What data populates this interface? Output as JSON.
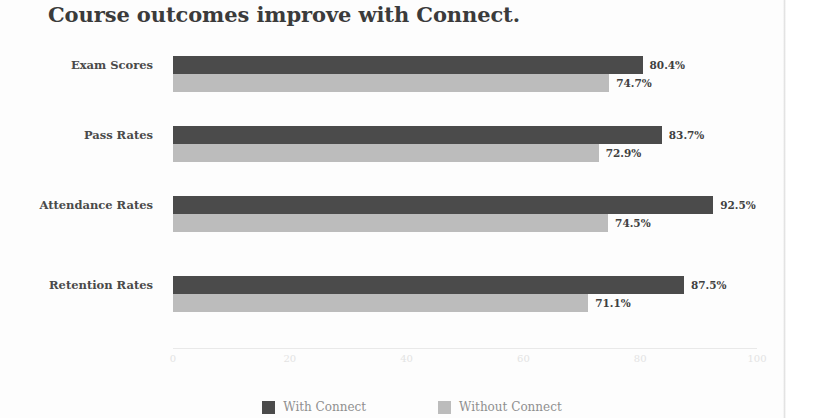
{
  "chart_data": {
    "type": "bar",
    "orientation": "horizontal",
    "title": "Course outcomes improve with Connect.",
    "categories": [
      "Exam Scores",
      "Pass Rates",
      "Attendance Rates",
      "Retention Rates"
    ],
    "series": [
      {
        "name": "With Connect",
        "color": "#4b4b4b",
        "values": [
          80.4,
          83.7,
          92.5,
          87.5
        ],
        "labels": [
          "80.4%",
          "83.7%",
          "92.5%",
          "87.5%"
        ]
      },
      {
        "name": "Without Connect",
        "color": "#bcbcbc",
        "values": [
          74.7,
          72.9,
          74.5,
          71.1
        ],
        "labels": [
          "74.7%",
          "72.9%",
          "74.5%",
          "71.1%"
        ]
      }
    ],
    "xlabel": "",
    "ylabel": "",
    "xlim": [
      0,
      100
    ],
    "xticks": [
      "0",
      "20",
      "40",
      "60",
      "80",
      "100"
    ],
    "xtick_values": [
      0,
      20,
      40,
      60,
      80,
      100
    ],
    "grid": false,
    "legend_position": "bottom"
  },
  "colors": {
    "with_connect": "#4b4b4b",
    "without_connect": "#bcbcbc",
    "title": "#3b3b3b",
    "category_label": "#4a4a4a",
    "value_label": "#3f3f3f",
    "tick_label": "#e3e3e3",
    "legend_label": "#8f8f8f",
    "background": "#fdfdfd"
  }
}
